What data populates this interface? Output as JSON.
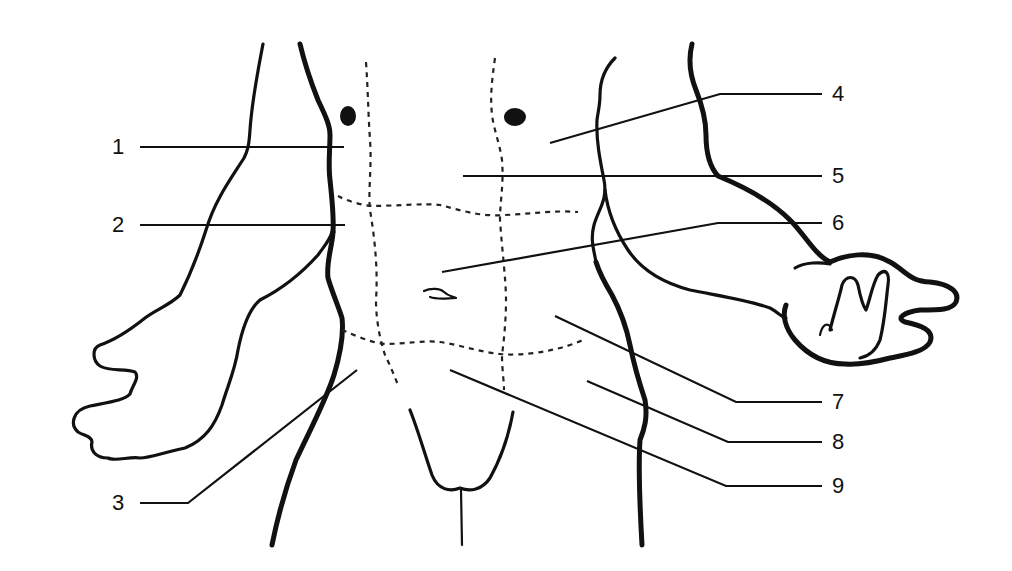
{
  "diagram": {
    "colors": {
      "ink": "#111111",
      "background": "#ffffff"
    },
    "labels": [
      {
        "id": "1",
        "text": "1",
        "side": "left",
        "x": 112,
        "y": 147,
        "line": [
          [
            140,
            147
          ],
          [
            344,
            147
          ]
        ]
      },
      {
        "id": "2",
        "text": "2",
        "side": "left",
        "x": 112,
        "y": 225,
        "line": [
          [
            140,
            225
          ],
          [
            345,
            225
          ]
        ]
      },
      {
        "id": "3",
        "text": "3",
        "side": "left",
        "x": 112,
        "y": 503,
        "line": [
          [
            140,
            503
          ],
          [
            188,
            503
          ],
          [
            357,
            370
          ]
        ]
      },
      {
        "id": "4",
        "text": "4",
        "side": "right",
        "x": 832,
        "y": 94,
        "line": [
          [
            822,
            94
          ],
          [
            720,
            94
          ],
          [
            550,
            143
          ]
        ]
      },
      {
        "id": "5",
        "text": "5",
        "side": "right",
        "x": 832,
        "y": 176,
        "line": [
          [
            822,
            176
          ],
          [
            463,
            176
          ]
        ]
      },
      {
        "id": "6",
        "text": "6",
        "side": "right",
        "x": 832,
        "y": 223,
        "line": [
          [
            822,
            223
          ],
          [
            718,
            223
          ],
          [
            442,
            272
          ]
        ]
      },
      {
        "id": "7",
        "text": "7",
        "side": "right",
        "x": 832,
        "y": 402,
        "line": [
          [
            822,
            402
          ],
          [
            736,
            402
          ],
          [
            555,
            316
          ]
        ]
      },
      {
        "id": "8",
        "text": "8",
        "side": "right",
        "x": 832,
        "y": 442,
        "line": [
          [
            822,
            442
          ],
          [
            728,
            442
          ],
          [
            587,
            381
          ]
        ]
      },
      {
        "id": "9",
        "text": "9",
        "side": "right",
        "x": 832,
        "y": 486,
        "line": [
          [
            822,
            486
          ],
          [
            726,
            486
          ],
          [
            450,
            370
          ]
        ]
      }
    ],
    "regions_grid": {
      "vertical_dashed": 2,
      "horizontal_dashed": 2,
      "umbilicus": true,
      "nipples": 2
    }
  }
}
